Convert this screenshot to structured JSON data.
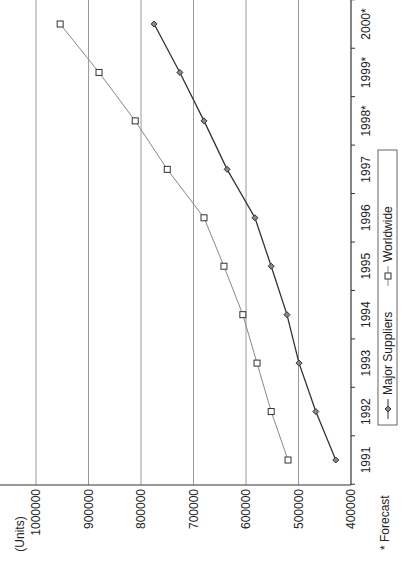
{
  "chart_data": {
    "type": "line",
    "title": "",
    "ylabel": "(Units)",
    "xlabel": "",
    "footnote": "* Forecast",
    "ylim": [
      400000,
      1000000
    ],
    "yticks": [
      400000,
      500000,
      600000,
      700000,
      800000,
      900000,
      1000000
    ],
    "grid": true,
    "legend_position": "bottom",
    "categories": [
      "1991",
      "1992",
      "1993",
      "1994",
      "1995",
      "1996",
      "1997",
      "1998*",
      "1999*",
      "2000*"
    ],
    "series": [
      {
        "name": "Major Suppliers",
        "marker": "diamond",
        "color": "#333333",
        "values": [
          429000,
          467000,
          499000,
          522000,
          552000,
          583000,
          636000,
          680000,
          726000,
          775000
        ]
      },
      {
        "name": "Worldwide",
        "marker": "square",
        "color": "#888888",
        "values": [
          520000,
          552000,
          579000,
          606000,
          642000,
          680000,
          750000,
          811000,
          880000,
          954000
        ]
      }
    ],
    "legend": [
      "Major Suppliers",
      "Worldwide"
    ]
  }
}
